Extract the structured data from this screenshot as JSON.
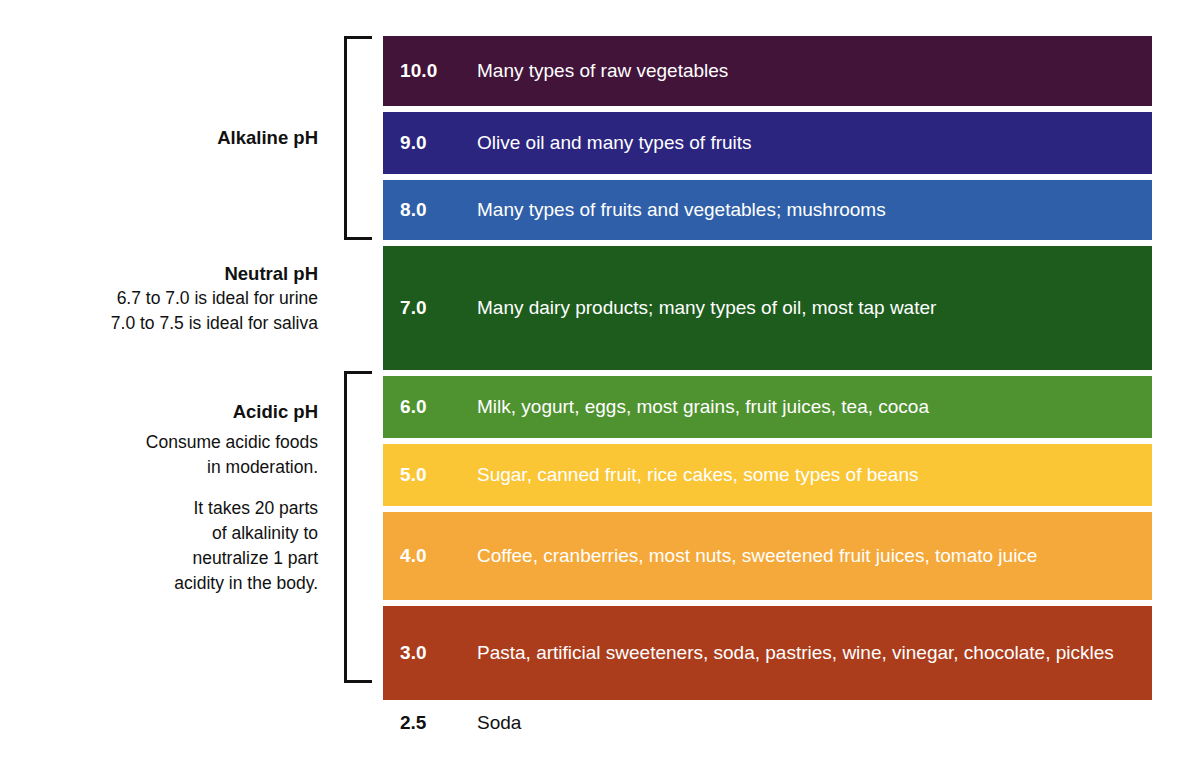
{
  "chart_data": {
    "type": "table",
    "xlabel": "",
    "ylabel": "pH",
    "categories": [
      "10.0",
      "9.0",
      "8.0",
      "7.0",
      "6.0",
      "5.0",
      "4.0",
      "3.0",
      "2.5"
    ],
    "values": [
      10.0,
      9.0,
      8.0,
      7.0,
      6.0,
      5.0,
      4.0,
      3.0,
      2.5
    ],
    "rows": [
      {
        "ph": "10.0",
        "foods": "Many types of raw vegetables",
        "color": "#42143a",
        "text_color": "#ffffff",
        "height": 70,
        "group": "alkaline"
      },
      {
        "ph": "9.0",
        "foods": "Olive oil and many types of fruits",
        "color": "#2b2580",
        "text_color": "#ffffff",
        "height": 62,
        "group": "alkaline"
      },
      {
        "ph": "8.0",
        "foods": "Many types of fruits and vegetables; mushrooms",
        "color": "#2f5fa8",
        "text_color": "#ffffff",
        "height": 60,
        "group": "alkaline"
      },
      {
        "ph": "7.0",
        "foods": "Many dairy products; many types of oil, most tap water",
        "color": "#1d5c1d",
        "text_color": "#ffffff",
        "height": 124,
        "group": "neutral"
      },
      {
        "ph": "6.0",
        "foods": "Milk, yogurt, eggs, most grains, fruit juices, tea, cocoa",
        "color": "#4f9230",
        "text_color": "#ffffff",
        "height": 62,
        "group": "acidic"
      },
      {
        "ph": "5.0",
        "foods": "Sugar, canned fruit, rice cakes, some types of beans",
        "color": "#fbc636",
        "text_color": "#ffffff",
        "height": 62,
        "group": "acidic"
      },
      {
        "ph": "4.0",
        "foods": "Coffee, cranberries, most nuts, sweetened fruit juices, tomato juice",
        "color": "#f5a93a",
        "text_color": "#ffffff",
        "height": 88,
        "group": "acidic"
      },
      {
        "ph": "3.0",
        "foods": "Pasta, artificial sweeteners, soda, pastries, wine, vinegar, chocolate, pickles",
        "color": "#ab3d1c",
        "text_color": "#ffffff",
        "height": 94,
        "group": "acidic"
      },
      {
        "ph": "2.5",
        "foods": "Soda",
        "color": "#ffffff",
        "text_color": "#111111",
        "height": 34,
        "group": "none"
      }
    ],
    "groups": [
      {
        "id": "alkaline",
        "title": "Alkaline pH",
        "lines": []
      },
      {
        "id": "neutral",
        "title": "Neutral pH",
        "lines": [
          "6.7 to 7.0 is ideal for urine",
          "7.0 to 7.5 is ideal for saliva"
        ]
      },
      {
        "id": "acidic",
        "title": "Acidic pH",
        "paragraph_1": "Consume acidic foods in moderation.",
        "paragraph_2": "It takes 20 parts of alkalinity to neutralize 1 part acidity in the body."
      }
    ],
    "grid": false,
    "legend_position": "left"
  },
  "groups": {
    "alkaline": {
      "title": "Alkaline pH"
    },
    "neutral": {
      "title": "Neutral pH",
      "line_1": "6.7 to 7.0 is ideal for urine",
      "line_2": "7.0 to 7.5 is ideal for saliva"
    },
    "acidic": {
      "title": "Acidic pH",
      "line_1": "Consume acidic foods",
      "line_2": "in moderation.",
      "line_3": "It takes 20 parts",
      "line_4": "of alkalinity to",
      "line_5": "neutralize 1 part",
      "line_6": "acidity in the body."
    }
  },
  "bars": [
    {
      "ph": "10.0",
      "foods": "Many types of raw vegetables"
    },
    {
      "ph": "9.0",
      "foods": "Olive oil and many types of fruits"
    },
    {
      "ph": "8.0",
      "foods": "Many types of fruits and vegetables; mushrooms"
    },
    {
      "ph": "7.0",
      "foods": "Many dairy products; many types of oil, most tap water"
    },
    {
      "ph": "6.0",
      "foods": "Milk, yogurt, eggs, most grains, fruit juices, tea, cocoa"
    },
    {
      "ph": "5.0",
      "foods": "Sugar, canned fruit, rice cakes, some types of beans"
    },
    {
      "ph": "4.0",
      "foods": "Coffee, cranberries, most nuts, sweetened fruit juices, tomato juice"
    },
    {
      "ph": "3.0",
      "foods": "Pasta, artificial sweeteners, soda, pastries, wine, vinegar, chocolate, pickles"
    }
  ],
  "trailing_row": {
    "ph": "2.5",
    "foods": "Soda"
  },
  "colors": {
    "bar_10": "#42143a",
    "bar_9": "#2b2580",
    "bar_8": "#2f5fa8",
    "bar_7": "#1d5c1d",
    "bar_6": "#4f9230",
    "bar_5": "#fbc636",
    "bar_4": "#f5a93a",
    "bar_3": "#ab3d1c",
    "text_on_bar": "#ffffff",
    "text_plain": "#111111",
    "bracket": "#111111",
    "background": "#ffffff"
  }
}
